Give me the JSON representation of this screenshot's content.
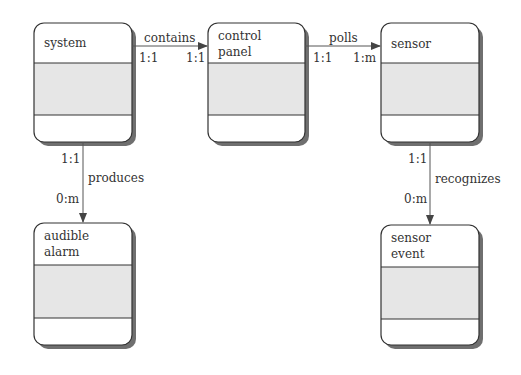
{
  "diagram": {
    "type": "object-relationship diagram",
    "objects": [
      {
        "id": "system",
        "name_lines": [
          "system"
        ]
      },
      {
        "id": "control_panel",
        "name_lines": [
          "control",
          "panel"
        ]
      },
      {
        "id": "sensor",
        "name_lines": [
          "sensor"
        ]
      },
      {
        "id": "audible_alarm",
        "name_lines": [
          "audible",
          "alarm"
        ]
      },
      {
        "id": "sensor_event",
        "name_lines": [
          "sensor",
          "event"
        ]
      }
    ],
    "relationships": [
      {
        "from": "system",
        "to": "control_panel",
        "label": "contains",
        "from_card": "1:1",
        "to_card": "1:1"
      },
      {
        "from": "control_panel",
        "to": "sensor",
        "label": "polls",
        "from_card": "1:1",
        "to_card": "1:m"
      },
      {
        "from": "system",
        "to": "audible_alarm",
        "label": "produces",
        "from_card": "1:1",
        "to_card": "0:m"
      },
      {
        "from": "sensor",
        "to": "sensor_event",
        "label": "recognizes",
        "from_card": "1:1",
        "to_card": "0:m"
      }
    ],
    "colors": {
      "border": "#333333",
      "attribute_fill": "#e6e6e6",
      "shadow": "#666666",
      "line": "#555555"
    }
  }
}
